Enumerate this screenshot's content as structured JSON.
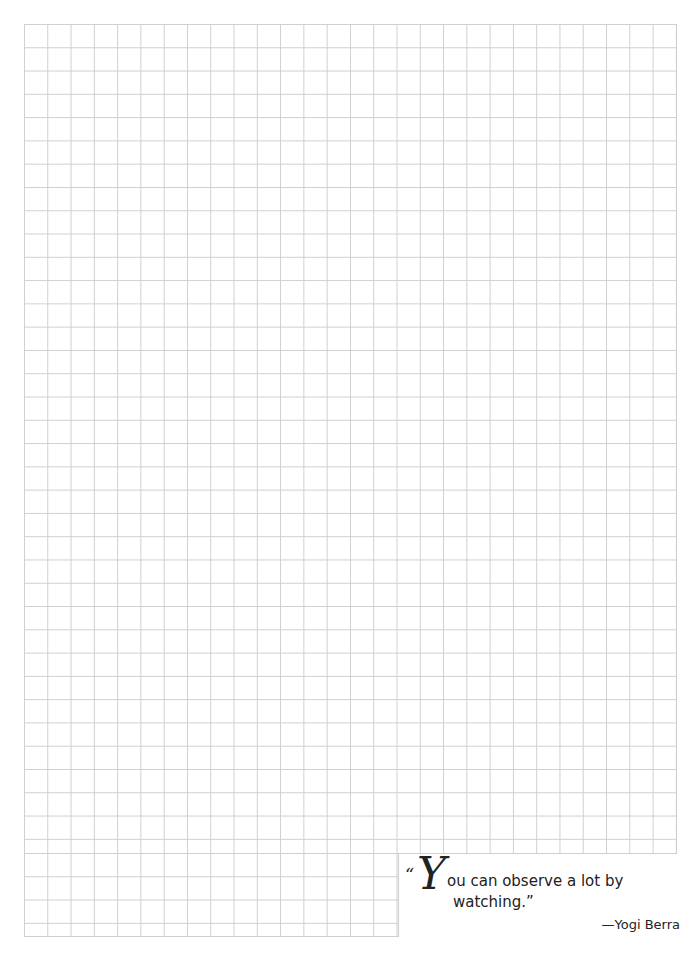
{
  "page": {
    "type": "graph-paper",
    "grid": {
      "columns": 28,
      "rows_upper": 35,
      "rows_lower_left": 4,
      "line_color": "#cfcfcf"
    }
  },
  "quote": {
    "open_mark": "“",
    "initial": "Y",
    "line1": "ou can observe a lot by",
    "line2": "watching.”",
    "attribution": "—Yogi Berra"
  }
}
